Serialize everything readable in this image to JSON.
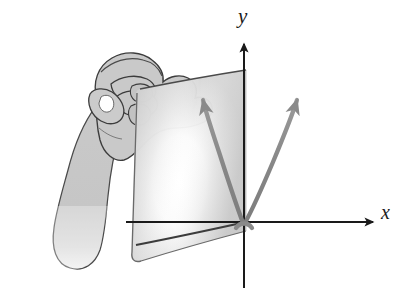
{
  "figure": {
    "background_color": "#ffffff"
  },
  "axes": {
    "y_label": "y",
    "x_label": "x",
    "origin": {
      "x": 244,
      "y": 222
    },
    "color": "#1a1a1a",
    "y_axis": {
      "top": 42,
      "bottom": 288,
      "arrow": "up"
    },
    "x_axis": {
      "left": 126,
      "right": 375,
      "arrow": "right"
    }
  },
  "curve": {
    "name": "parabola",
    "color": "#8a8a8a",
    "vertex": {
      "x": 244,
      "y": 222
    },
    "left_arrow": true,
    "right_arrow": true,
    "stroke_width": 4.2
  },
  "plane": {
    "name": "transparent-sheet",
    "fill_light": "#f4f4f4",
    "fill_mid": "#d6d6d6",
    "fill_dark": "#c2c2c2",
    "edge_color": "#4a4a4a",
    "corners": {
      "top_left": {
        "x": 140,
        "y": 89
      },
      "top_right": {
        "x": 246,
        "y": 70
      },
      "bottom_right": {
        "x": 246,
        "y": 231
      },
      "bottom_left": {
        "x": 133,
        "y": 263
      }
    }
  },
  "hand": {
    "name": "hand-gripping-corner",
    "fill": "#c9c9c9",
    "outline": "#3c3c3c",
    "highlight": "#ffffff",
    "parts": [
      "forearm",
      "wrist",
      "thumb",
      "index-finger",
      "middle-finger",
      "knuckles"
    ]
  }
}
